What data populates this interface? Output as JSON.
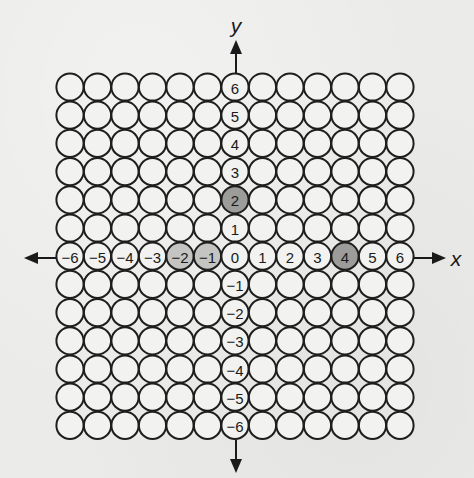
{
  "diagram": {
    "type": "coordinate-grid-of-circles",
    "axes": {
      "x_label": "x",
      "y_label": "y",
      "x_ticks": [
        "-6",
        "-5",
        "-4",
        "-3",
        "-2",
        "-1",
        "0",
        "1",
        "2",
        "3",
        "4",
        "5",
        "6"
      ],
      "y_ticks": [
        "6",
        "5",
        "4",
        "3",
        "2",
        "1",
        "0",
        "-1",
        "-2",
        "-3",
        "-4",
        "-5",
        "-6"
      ]
    },
    "grid": {
      "columns": 13,
      "rows": 13,
      "x_range": [
        -6,
        6
      ],
      "y_range": [
        -6,
        6
      ]
    },
    "shaded_points": [
      {
        "x": 0,
        "y": 2,
        "shade": "dark"
      },
      {
        "x": 4,
        "y": 0,
        "shade": "dark"
      },
      {
        "x": -2,
        "y": 0,
        "shade": "light"
      },
      {
        "x": -1,
        "y": 0,
        "shade": "light"
      }
    ],
    "colors": {
      "background": "#ebebea",
      "circle_fill": "#f2f2f0",
      "circle_stroke": "#1e1e1e",
      "shade_dark": "#9c9c9a",
      "shade_light": "#c4c4c2",
      "ink": "#1a1a1a"
    }
  }
}
